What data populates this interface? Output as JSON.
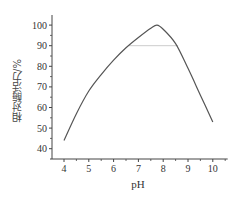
{
  "chart_data": {
    "type": "line",
    "title": "",
    "xlabel": "pH",
    "ylabel": "相对酶活力/%",
    "xlim": [
      3.5,
      10.6
    ],
    "ylim": [
      35,
      105
    ],
    "xticks": [
      4,
      5,
      6,
      7,
      8,
      9,
      10
    ],
    "yticks": [
      40,
      50,
      60,
      70,
      80,
      90,
      100
    ],
    "xtick_labels": [
      "4",
      "5",
      "6",
      "7",
      "8",
      "9",
      "10"
    ],
    "ytick_labels": [
      "40",
      "50",
      "60",
      "70",
      "80",
      "90",
      "100"
    ],
    "grid": false,
    "legend": null,
    "series": [
      {
        "name": "Relative enzyme activity",
        "color": "#555555",
        "x": [
          4,
          4.5,
          5,
          5.5,
          6,
          6.5,
          7,
          7.5,
          7.75,
          8,
          8.5,
          9,
          9.5,
          10
        ],
        "y": [
          44,
          57,
          68,
          76,
          83,
          89,
          94,
          98.5,
          100,
          98,
          91,
          79,
          66,
          53
        ]
      }
    ],
    "annotations": [
      {
        "type": "hline",
        "y": 90,
        "x_start": 6.6,
        "x_end": 8.6,
        "color": "#cccccc",
        "description": "90% activity reference line"
      }
    ]
  },
  "colors": {
    "axis": "#444444",
    "curve": "#555555",
    "reference_line": "#cccccc",
    "text": "#333333"
  }
}
